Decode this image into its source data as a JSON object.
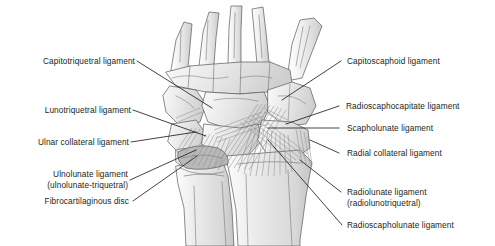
{
  "figure": {
    "background_color": "#ffffff",
    "text_color": "#231f20",
    "bone_fill": "#e9e9e9",
    "bone_outline": "#58595b",
    "ligament_fiber_color": "#8c8c8c",
    "leader_line_color": "#231f20"
  },
  "labels_left": [
    {
      "id": "capitotriquetral",
      "line1": "Capitotriquetral ligament",
      "line2": ""
    },
    {
      "id": "lunotriquetral",
      "line1": "Lunotriquetral ligament",
      "line2": ""
    },
    {
      "id": "ulnar-collateral",
      "line1": "Ulnar collateral ligament",
      "line2": ""
    },
    {
      "id": "ulnolunate",
      "line1": "Ulnolunate ligament",
      "line2": "(ulnolunate-triquetral)"
    },
    {
      "id": "fibrocartilaginous-disc",
      "line1": "Fibrocartilaginous disc",
      "line2": ""
    }
  ],
  "labels_right": [
    {
      "id": "capitoscaphoid",
      "line1": "Capitoscaphoid ligament",
      "line2": ""
    },
    {
      "id": "radioscaphocapitate",
      "line1": "Radioscaphocapitate ligament",
      "line2": ""
    },
    {
      "id": "scapholunate",
      "line1": "Scapholunate ligament",
      "line2": ""
    },
    {
      "id": "radial-collateral",
      "line1": "Radial collateral ligament",
      "line2": ""
    },
    {
      "id": "radiolunate",
      "line1": "Radiolunate ligament",
      "line2": "(radiolunotriquetral)"
    },
    {
      "id": "radioscapholunate",
      "line1": "Radioscapholunate ligament",
      "line2": ""
    }
  ]
}
